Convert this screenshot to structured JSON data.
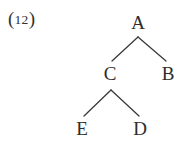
{
  "figure": {
    "label": {
      "open_paren": "(",
      "number": "12",
      "close_paren": ")",
      "full_text": "(12)"
    },
    "background_color": "#ffffff",
    "line_color": "#3a3a38",
    "text_color": "#2e2d2b",
    "width": 192,
    "height": 153
  },
  "tree": {
    "type": "syntax-tree",
    "root": "A",
    "nodes": [
      {
        "id": "A",
        "label": "A",
        "x": 138,
        "y": 22,
        "level": 0
      },
      {
        "id": "C",
        "label": "C",
        "x": 110,
        "y": 73,
        "level": 1
      },
      {
        "id": "B",
        "label": "B",
        "x": 168,
        "y": 73,
        "level": 1
      },
      {
        "id": "E",
        "label": "E",
        "x": 82,
        "y": 128,
        "level": 2
      },
      {
        "id": "D",
        "label": "D",
        "x": 140,
        "y": 128,
        "level": 2
      }
    ],
    "edges": [
      {
        "from": "A",
        "to": "C",
        "x1": 138,
        "y1": 37,
        "x2": 112,
        "y2": 61
      },
      {
        "from": "A",
        "to": "B",
        "x1": 138,
        "y1": 37,
        "x2": 166,
        "y2": 61
      },
      {
        "from": "C",
        "to": "E",
        "x1": 111,
        "y1": 90,
        "x2": 84,
        "y2": 116
      },
      {
        "from": "C",
        "to": "D",
        "x1": 111,
        "y1": 90,
        "x2": 139,
        "y2": 116
      }
    ]
  }
}
